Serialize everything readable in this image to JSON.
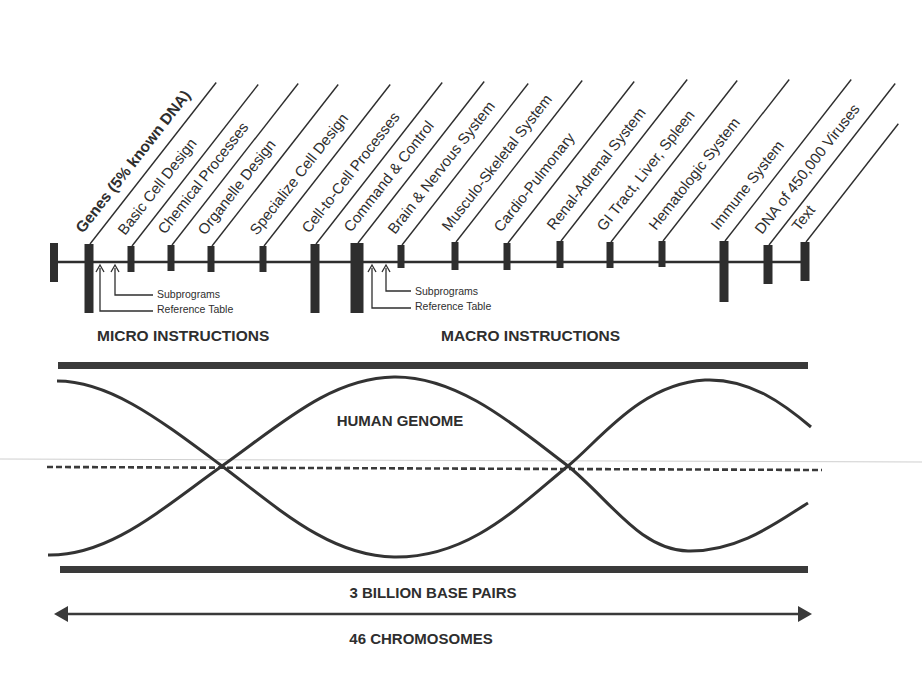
{
  "diagram": {
    "colors": {
      "ink": "#2e2e2e",
      "background": "#ffffff",
      "faint_line": "#c9c9c9"
    },
    "timeline": {
      "line_y": 262,
      "x_start": 53,
      "x_end": 806,
      "start_marker": {
        "x": 54,
        "top": 243,
        "bottom": 282,
        "width": 8
      },
      "markers": [
        {
          "id": "genes",
          "label": "Genes (5% known DNA)",
          "bold": true,
          "x": 89,
          "top": 244,
          "bottom": 313,
          "width": 9
        },
        {
          "id": "basic-cell",
          "label": "Basic Cell Design",
          "bold": false,
          "x": 131,
          "top": 246,
          "bottom": 272,
          "width": 7
        },
        {
          "id": "chemical",
          "label": "Chemical Processes",
          "bold": false,
          "x": 171,
          "top": 245,
          "bottom": 271,
          "width": 7
        },
        {
          "id": "organelle",
          "label": "Organelle Design",
          "bold": false,
          "x": 211,
          "top": 246,
          "bottom": 272,
          "width": 7
        },
        {
          "id": "specialize",
          "label": "Specialize Cell Design",
          "bold": false,
          "x": 263,
          "top": 246,
          "bottom": 272,
          "width": 7
        },
        {
          "id": "cell-to-cell",
          "label": "Cell-to-Cell Processes",
          "bold": false,
          "x": 315,
          "top": 244,
          "bottom": 313,
          "width": 9
        },
        {
          "id": "command",
          "label": "Command & Control",
          "bold": false,
          "x": 357,
          "top": 243,
          "bottom": 313,
          "width": 13
        },
        {
          "id": "brain",
          "label": "Brain &  Nervous System",
          "bold": false,
          "x": 401,
          "top": 245,
          "bottom": 268,
          "width": 7
        },
        {
          "id": "musculo",
          "label": "Musculo-Skeletal System",
          "bold": false,
          "x": 455,
          "top": 242,
          "bottom": 270,
          "width": 7
        },
        {
          "id": "cardio",
          "label": "Cardio-Pulmonary",
          "bold": false,
          "x": 507,
          "top": 243,
          "bottom": 270,
          "width": 7
        },
        {
          "id": "renal",
          "label": "Renal-Adrenal System",
          "bold": false,
          "x": 560,
          "top": 241,
          "bottom": 268,
          "width": 7
        },
        {
          "id": "gi",
          "label": "GI Tract, Liver, Spleen",
          "bold": false,
          "x": 610,
          "top": 242,
          "bottom": 268,
          "width": 7
        },
        {
          "id": "hemato",
          "label": "Hematologic System",
          "bold": false,
          "x": 662,
          "top": 241,
          "bottom": 267,
          "width": 7
        },
        {
          "id": "immune",
          "label": "Immune System",
          "bold": false,
          "x": 724,
          "top": 241,
          "bottom": 302,
          "width": 9
        },
        {
          "id": "dna-virus",
          "label": "DNA of 450,000 Viruses",
          "bold": false,
          "x": 768,
          "top": 245,
          "bottom": 284,
          "width": 9
        },
        {
          "id": "text",
          "label": "Text",
          "bold": false,
          "x": 805,
          "top": 242,
          "bottom": 281,
          "width": 9
        }
      ]
    },
    "micro_group": {
      "heading": "MICRO INSTRUCTIONS",
      "subprograms_label": "Subprograms",
      "reference_table_label": "Reference Table"
    },
    "macro_group": {
      "heading": "MACRO INSTRUCTIONS",
      "subprograms_label": "Subprograms",
      "reference_table_label": "Reference Table"
    },
    "genome": {
      "label": "HUMAN GENOME",
      "base_pairs_label": "3 BILLION BASE PAIRS",
      "chromosomes_label": "46 CHROMOSOMES"
    }
  }
}
